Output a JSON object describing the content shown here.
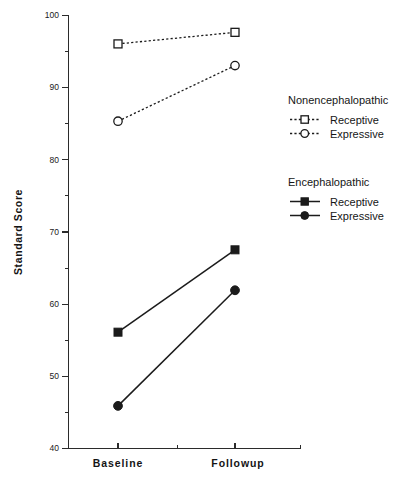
{
  "chart_data": {
    "type": "line",
    "title": "",
    "subtitle": "",
    "xlabel": "",
    "ylabel": "Standard  Score",
    "categories": [
      "Baseline",
      "Followup"
    ],
    "x": [
      0,
      1
    ],
    "ylim": [
      40,
      100
    ],
    "yticks": [
      40,
      50,
      60,
      70,
      80,
      90,
      100
    ],
    "ytick_labels": [
      "40",
      "50",
      "60",
      "70",
      "80",
      "90",
      "100"
    ],
    "yticks_minor": [
      45,
      55,
      65,
      75,
      85,
      95
    ],
    "grid": false,
    "legend_position": "right",
    "series": [
      {
        "name": "Receptive",
        "group": "Nonencephalopathic",
        "values": [
          96.0,
          97.6
        ],
        "marker": "open-square",
        "linestyle": "dashed",
        "color": "#1b1b1b"
      },
      {
        "name": "Expressive",
        "group": "Nonencephalopathic",
        "values": [
          85.3,
          93.0
        ],
        "marker": "open-circle",
        "linestyle": "dashed",
        "color": "#1b1b1b"
      },
      {
        "name": "Receptive",
        "group": "Encephalopathic",
        "values": [
          56.1,
          67.5
        ],
        "marker": "filled-square",
        "linestyle": "solid",
        "color": "#1b1b1b"
      },
      {
        "name": "Expressive",
        "group": "Encephalopathic",
        "values": [
          45.9,
          61.9
        ],
        "marker": "filled-circle",
        "linestyle": "solid",
        "color": "#1b1b1b"
      }
    ],
    "legend": [
      {
        "group_title": "Nonencephalopathic",
        "entries": [
          {
            "label": "Receptive",
            "marker": "open-square",
            "linestyle": "dashed"
          },
          {
            "label": "Expressive",
            "marker": "open-circle",
            "linestyle": "dashed"
          }
        ]
      },
      {
        "group_title": "Encephalopathic",
        "entries": [
          {
            "label": "Receptive",
            "marker": "filled-square",
            "linestyle": "solid"
          },
          {
            "label": "Expressive",
            "marker": "filled-circle",
            "linestyle": "solid"
          }
        ]
      }
    ]
  },
  "axis": {
    "y_title": "Standard  Score",
    "y_labels": [
      "100",
      "90",
      "80",
      "70",
      "60",
      "50",
      "40"
    ],
    "x_labels": [
      "Baseline",
      "Followup"
    ]
  },
  "legend": {
    "group1_title": "Nonencephalopathic",
    "group1_item1": "Receptive",
    "group1_item2": "Expressive",
    "group2_title": "Encephalopathic",
    "group2_item1": "Receptive",
    "group2_item2": "Expressive"
  },
  "colors": {
    "ink": "#1b1b1b",
    "axis": "#2b2b2b",
    "background": "#ffffff"
  }
}
